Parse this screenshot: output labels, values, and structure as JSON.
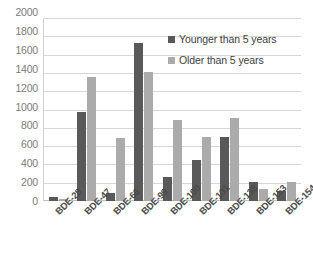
{
  "chart_data": {
    "type": "bar",
    "title": "",
    "subtitle": "",
    "xlabel": "",
    "ylabel": "",
    "ylim": [
      0,
      2000
    ],
    "ytick_step": 200,
    "yticks": [
      2000,
      1800,
      1600,
      1400,
      1200,
      1000,
      800,
      600,
      400,
      200,
      0
    ],
    "grid": true,
    "legend_position": "upper-right-inside",
    "categories": [
      "BDE-28",
      "BDE-47",
      "BDE-66",
      "BDE-99",
      "BDE-100",
      "BDE-101",
      "BDE-138",
      "BDE-153",
      "BDE-154"
    ],
    "series": [
      {
        "name": "Younger than 5 years",
        "color": "#595959",
        "values": [
          40,
          970,
          85,
          1730,
          260,
          450,
          700,
          210,
          110
        ]
      },
      {
        "name": "Older than 5 years",
        "color": "#ababab",
        "values": [
          20,
          1360,
          690,
          1410,
          880,
          705,
          910,
          130,
          205
        ]
      }
    ]
  },
  "legend": {
    "items": [
      {
        "label": "Younger than 5 years"
      },
      {
        "label": "Older than 5 years"
      }
    ]
  },
  "colors": {
    "younger": "#595959",
    "older": "#ababab",
    "gridline": "#d7d7d7",
    "axis_text": "#7b7b7b",
    "background": "#ffffff"
  }
}
